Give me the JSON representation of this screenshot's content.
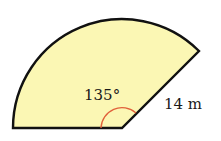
{
  "diagram": {
    "shape": "circular-sector",
    "angle_label": "135°",
    "radius_label": "14 m",
    "angle_degrees": 135,
    "radius_value": 14,
    "radius_unit": "m",
    "colors": {
      "fill": "#fbf7b4",
      "stroke": "#111111",
      "angle_marker": "#e0603a"
    }
  }
}
